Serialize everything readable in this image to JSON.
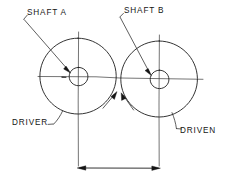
{
  "diagram": {
    "type": "mechanical-engineering-sketch",
    "style": "hand-drawn line drawing",
    "background_color": "#ffffff",
    "line_color": "#1d1d1d",
    "labels": {
      "shaft_a": "SHAFT A",
      "shaft_b": "SHAFT B",
      "driver": "DRIVER",
      "driven": "DRIVEN"
    },
    "components": [
      {
        "name": "driver-pulley",
        "label": "DRIVER",
        "shaft_label": "SHAFT A",
        "center_x": 78,
        "center_y": 76,
        "outer_radius": 38,
        "hub_radius": 9
      },
      {
        "name": "driven-pulley",
        "label": "DRIVEN",
        "shaft_label": "SHAFT B",
        "center_x": 159,
        "center_y": 79,
        "outer_radius": 38,
        "hub_radius": 9
      }
    ],
    "dimension": {
      "name": "center-distance",
      "from_x": 78,
      "to_x": 159,
      "y": 168,
      "value_text": ""
    },
    "annotations": [
      "leader from SHAFT A label to driver hub",
      "leader from SHAFT B label to driven hub",
      "leader from DRIVER label to driver rim",
      "leader from DRIVEN label to driven rim",
      "two arrowheads at pulley tangency point"
    ]
  }
}
